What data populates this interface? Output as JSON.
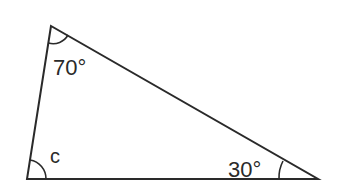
{
  "diagram": {
    "type": "triangle",
    "vertices": {
      "top": [
        51,
        26
      ],
      "bottom_left": [
        27,
        179
      ],
      "bottom_right": [
        318,
        179
      ]
    },
    "angles": [
      {
        "vertex": "top",
        "label": "70°",
        "value": 70
      },
      {
        "vertex": "bottom_left",
        "label": "c",
        "value": null
      },
      {
        "vertex": "bottom_right",
        "label": "30°",
        "value": 30
      }
    ],
    "colors": {
      "stroke": "#2a2a2a",
      "background": "#ffffff"
    }
  }
}
